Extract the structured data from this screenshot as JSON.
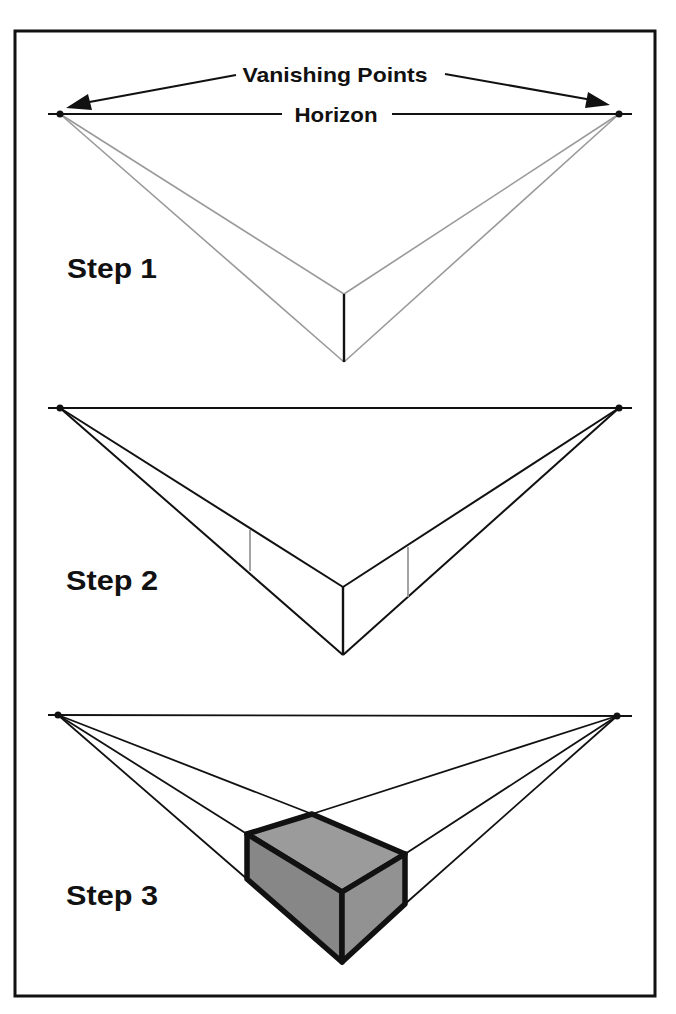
{
  "title_labels": {
    "vanishing_points": "Vanishing Points",
    "horizon": "Horizon"
  },
  "steps": [
    {
      "label": "Step 1"
    },
    {
      "label": "Step 2"
    },
    {
      "label": "Step 3"
    }
  ],
  "colors": {
    "frame": "#111111",
    "ink": "#111111",
    "guide_gray": "#9a9a9a",
    "box_top": "#9b9b9b",
    "box_left": "#878787",
    "box_right": "#929292",
    "background": "#ffffff"
  },
  "geometry": {
    "frame": {
      "x": 15,
      "y": 31,
      "width": 640,
      "height": 965
    },
    "step1": {
      "horizon_y": 114,
      "vp_left": [
        60,
        114
      ],
      "vp_right": [
        619,
        114
      ],
      "front_edge": {
        "x": 344,
        "top": 294,
        "bottom": 362
      }
    },
    "step2": {
      "horizon_y": 408,
      "vp_left": [
        60,
        408
      ],
      "vp_right": [
        619,
        408
      ],
      "front_edge": {
        "x": 343,
        "top": 587,
        "bottom": 655
      },
      "left_back_edge": {
        "x": 250,
        "top": 531,
        "bottom": 571
      },
      "right_back_edge": {
        "x": 408,
        "top": 548,
        "bottom": 597
      }
    },
    "step3": {
      "horizon_y": 715,
      "vp_left": [
        58,
        715
      ],
      "vp_right": [
        617,
        716
      ],
      "box": {
        "back_top": [
          312,
          814
        ],
        "left_top": [
          247,
          834
        ],
        "right_top": [
          405,
          854
        ],
        "front_top": [
          342,
          892
        ],
        "left_bottom": [
          247,
          879
        ],
        "right_bottom": [
          405,
          904
        ],
        "front_bottom": [
          342,
          962
        ]
      }
    }
  }
}
